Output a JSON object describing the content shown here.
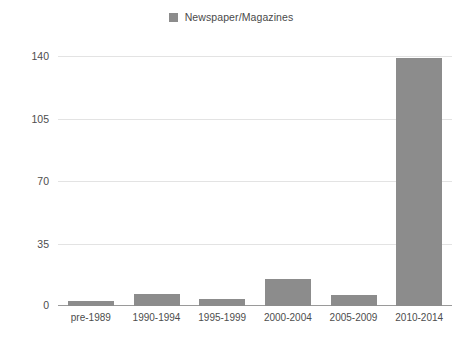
{
  "chart_data": {
    "type": "bar",
    "title": "",
    "xlabel": "",
    "ylabel": "",
    "categories": [
      "pre-1989",
      "1990-1994",
      "1995-1999",
      "2000-2004",
      "2005-2009",
      "2010-2014"
    ],
    "values": [
      3,
      7,
      4,
      15,
      6,
      139
    ],
    "series": [
      {
        "name": "Newspaper/Magazines",
        "values": [
          3,
          7,
          4,
          15,
          6,
          139
        ],
        "color": "#8c8c8c"
      }
    ],
    "ylim": [
      0,
      140
    ],
    "yticks": [
      0,
      35,
      70,
      105,
      140
    ],
    "ytick_labels": [
      "0",
      "35",
      "70",
      "105",
      "140"
    ],
    "grid": true,
    "legend_position": "top-center"
  },
  "legend": {
    "entries": [
      {
        "label": "Newspaper/Magazines",
        "swatch_name": "legend-swatch-newspaper-magazines",
        "color": "#8c8c8c"
      }
    ]
  },
  "colors": {
    "bar": "#8c8c8c",
    "gridline": "#e3e3e3",
    "axis": "#9a9a9a",
    "text": "#4d4d4d",
    "background": "#ffffff"
  }
}
